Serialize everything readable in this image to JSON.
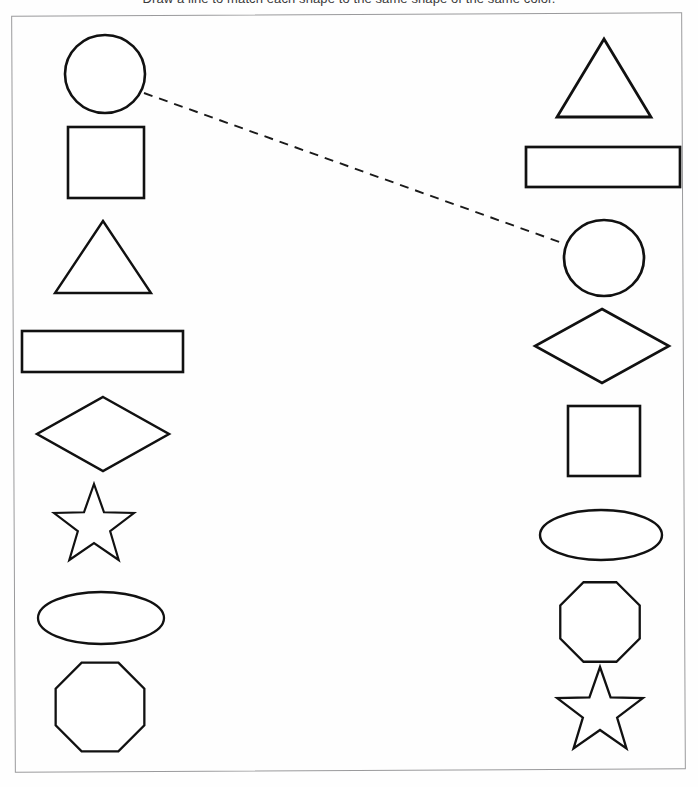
{
  "instruction": "Draw a line to match each shape to the same shape of the same color.",
  "worksheet": {
    "title": "Shape Matching Worksheet",
    "frame": {
      "x": 13,
      "y": 14,
      "width": 671,
      "height": 757,
      "stroke": "#9a9a9c"
    }
  },
  "style": {
    "shape_stroke": "#111111",
    "shape_fill": "#ffffff",
    "connector_stroke": "#1a1a1a",
    "background": "#fefefe"
  },
  "columns": [
    {
      "id": "left-column",
      "name": "left",
      "shapes": [
        {
          "id": "left-circle",
          "type": "circle",
          "label": "Circle",
          "cx": 105,
          "cy": 74,
          "rx": 40,
          "ry": 39,
          "stroke_width": 2.6
        },
        {
          "id": "left-square",
          "type": "square",
          "label": "Square",
          "x": 68,
          "y": 127,
          "width": 76,
          "height": 71,
          "stroke_width": 2.6
        },
        {
          "id": "left-triangle",
          "type": "triangle",
          "label": "Triangle",
          "cx": 103,
          "top_y": 221,
          "base_y": 293,
          "half_base": 48,
          "stroke_width": 2.4
        },
        {
          "id": "left-rectangle",
          "type": "rectangle",
          "label": "Rectangle",
          "x": 22,
          "y": 331,
          "width": 161,
          "height": 41,
          "stroke_width": 2.6
        },
        {
          "id": "left-diamond",
          "type": "diamond",
          "label": "Diamond",
          "cx": 103,
          "cy": 434,
          "rx": 66,
          "ry": 37,
          "stroke_width": 2.5
        },
        {
          "id": "left-star",
          "type": "star",
          "label": "Star",
          "cx": 94,
          "cy": 526,
          "outer_r": 42,
          "inner_r": 17,
          "stroke_width": 2.2
        },
        {
          "id": "left-ellipse",
          "type": "ellipse",
          "label": "Ellipse",
          "cx": 101,
          "cy": 618,
          "rx": 63,
          "ry": 26,
          "stroke_width": 2.3
        },
        {
          "id": "left-octagon",
          "type": "octagon",
          "label": "Octagon",
          "cx": 100,
          "cy": 707,
          "r": 48,
          "stroke_width": 2.3
        }
      ]
    },
    {
      "id": "right-column",
      "name": "right",
      "shapes": [
        {
          "id": "right-triangle",
          "type": "triangle",
          "label": "Triangle",
          "cx": 604,
          "top_y": 39,
          "base_y": 117,
          "half_base": 47,
          "stroke_width": 2.8
        },
        {
          "id": "right-rectangle",
          "type": "rectangle",
          "label": "Rectangle",
          "x": 526,
          "y": 147,
          "width": 154,
          "height": 40,
          "stroke_width": 2.7
        },
        {
          "id": "right-circle",
          "type": "circle",
          "label": "Circle",
          "cx": 604,
          "cy": 258,
          "rx": 40,
          "ry": 38,
          "stroke_width": 2.7
        },
        {
          "id": "right-diamond",
          "type": "diamond",
          "label": "Diamond",
          "cx": 602,
          "cy": 346,
          "rx": 67,
          "ry": 37,
          "stroke_width": 2.6
        },
        {
          "id": "right-square",
          "type": "square",
          "label": "Square",
          "x": 568,
          "y": 406,
          "width": 72,
          "height": 70,
          "stroke_width": 2.6
        },
        {
          "id": "right-ellipse",
          "type": "ellipse",
          "label": "Ellipse",
          "cx": 601,
          "cy": 535,
          "rx": 61,
          "ry": 25,
          "stroke_width": 2.4
        },
        {
          "id": "right-octagon",
          "type": "octagon",
          "label": "Octagon",
          "cx": 600,
          "cy": 622,
          "r": 43,
          "stroke_width": 2.3
        },
        {
          "id": "right-star",
          "type": "star",
          "label": "Star",
          "cx": 600,
          "cy": 712,
          "outer_r": 45,
          "inner_r": 18,
          "stroke_width": 2.3
        }
      ]
    }
  ],
  "connections": [
    {
      "id": "connection-circle-to-circle",
      "from": "left-circle",
      "to": "right-circle",
      "from_label": "Circle",
      "to_label": "Circle",
      "x1": 144,
      "y1": 93,
      "x2": 565,
      "y2": 244,
      "style": "dashed",
      "dash": "9 7",
      "stroke_width": 1.9
    }
  ]
}
